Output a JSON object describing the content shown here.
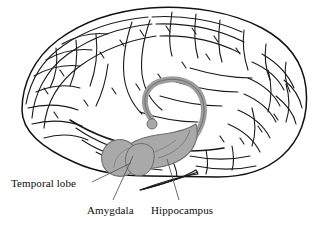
{
  "figure": {
    "kind": "anatomical-line-drawing",
    "background_color": "#ffffff",
    "outline_color": "#121212",
    "shading_color": "#a9a9a9",
    "shading_edge_color": "#6e6e6e",
    "leader_line_color": "#5a5a5a",
    "width": 324,
    "height": 235
  },
  "labels": [
    {
      "id": "temporal-lobe",
      "text": "Temporal lobe",
      "x": 11,
      "y": 177,
      "leader": {
        "from_x": 92,
        "from_y": 182,
        "to_x": 131,
        "to_y": 163
      }
    },
    {
      "id": "amygdala",
      "text": "Amygdala",
      "x": 87,
      "y": 204,
      "leader": {
        "from_x": 113,
        "from_y": 200,
        "to_x": 133,
        "to_y": 156
      }
    },
    {
      "id": "hippocampus",
      "text": "Hippocampus",
      "x": 151,
      "y": 204,
      "leader": {
        "from_x": 179,
        "from_y": 200,
        "to_x": 167,
        "to_y": 159
      }
    }
  ],
  "structures": [
    {
      "id": "cerebral-cortex",
      "name": "cerebral cortex with gyri and sulci",
      "shaded": false
    },
    {
      "id": "fornix",
      "name": "fornix arch",
      "shaded": true
    },
    {
      "id": "mammillary-body",
      "name": "mammillary body knob",
      "shaded": true
    },
    {
      "id": "hippocampus-body",
      "name": "hippocampus body",
      "shaded": true
    },
    {
      "id": "amygdala-bulb",
      "name": "amygdala bulb",
      "shaded": true
    },
    {
      "id": "brainstem",
      "name": "brainstem wedge",
      "shaded": false
    },
    {
      "id": "cerebellum",
      "name": "cerebellum",
      "shaded": false
    }
  ]
}
